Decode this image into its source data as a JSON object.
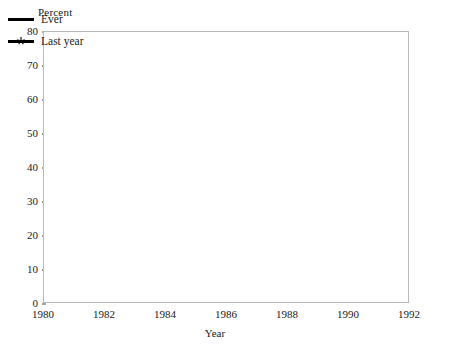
{
  "axis": {
    "y_title": "Percent",
    "x_title": "Year",
    "y_ticks": [
      "0",
      "10",
      "20",
      "30",
      "40",
      "50",
      "60",
      "70",
      "80"
    ],
    "x_ticks": [
      "1980",
      "1982",
      "1984",
      "1986",
      "1988",
      "1990",
      "1992"
    ]
  },
  "legend": {
    "items": [
      {
        "label": "Ever",
        "marker": "line-swatch-icon"
      },
      {
        "label": "Last year",
        "marker": "star-marker-icon"
      }
    ]
  },
  "chart_data": {
    "type": "line",
    "title": "",
    "subtitle": "",
    "xlabel": "Year",
    "ylabel": "Percent",
    "x": [
      1980,
      1982,
      1984,
      1986,
      1988,
      1990,
      1992
    ],
    "xlim": [
      1980,
      1992
    ],
    "ylim": [
      0,
      80
    ],
    "ytick_step": 10,
    "grid": true,
    "grid_style": "dotted-horizontal",
    "legend_position": "top-left-inside",
    "series": [
      {
        "name": "Ever",
        "values": [
          59,
          54,
          54.5,
          71,
          73,
          76,
          74
        ],
        "marker": "none",
        "color": "#000000"
      },
      {
        "name": "Last year",
        "values": [
          25,
          23,
          23.5,
          34,
          37,
          43,
          43
        ],
        "marker": "star",
        "color": "#000000"
      }
    ]
  }
}
